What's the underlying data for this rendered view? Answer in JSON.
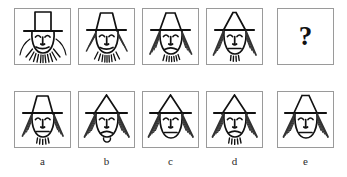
{
  "puzzle": {
    "type": "visual-matrix-reasoning",
    "title": "",
    "question_mark": "?",
    "sequence_row": {
      "name": "sequence",
      "cells": [
        {
          "id": "seq-1",
          "position": 1,
          "hat_shape": "rectangle",
          "hat_top_width": 34,
          "side_hair": "none",
          "beard": "long-rays",
          "beard_ray_count": 11,
          "mouth": "smile-curve"
        },
        {
          "id": "seq-2",
          "position": 2,
          "hat_shape": "wide-trapezoid",
          "hat_top_width": 26,
          "side_hair": "short-hatched",
          "beard": "medium-rays",
          "beard_ray_count": 9,
          "mouth": "smile-curve"
        },
        {
          "id": "seq-3",
          "position": 3,
          "hat_shape": "narrow-trapezoid",
          "hat_top_width": 18,
          "side_hair": "medium-hatched",
          "beard": "short-tufts",
          "beard_ray_count": 7,
          "mouth": "frown-curve"
        },
        {
          "id": "seq-4",
          "position": 4,
          "hat_shape": "triangle",
          "hat_top_width": 6,
          "side_hair": "long-hatched",
          "beard": "few-tufts",
          "beard_ray_count": 4,
          "mouth": "straight-line"
        },
        {
          "id": "seq-5",
          "position": 5,
          "hat_shape": "unknown",
          "side_hair": "unknown",
          "beard": "unknown",
          "mouth": "unknown",
          "is_question": true
        }
      ]
    },
    "options_row": {
      "name": "answer-options",
      "labels": [
        "a",
        "b",
        "c",
        "d",
        "e"
      ],
      "cells": [
        {
          "id": "opt-a",
          "label": "a",
          "hat_shape": "narrow-trapezoid",
          "hat_top_width": 20,
          "side_hair": "medium-hatched",
          "beard": "few-tufts",
          "beard_ray_count": 5,
          "mouth": "straight-line"
        },
        {
          "id": "opt-b",
          "label": "b",
          "hat_shape": "triangle",
          "hat_top_width": 4,
          "side_hair": "long-hatched",
          "beard": "single-tuft",
          "beard_ray_count": 1,
          "mouth": "frown-curve"
        },
        {
          "id": "opt-c",
          "label": "c",
          "hat_shape": "triangle",
          "hat_top_width": 4,
          "side_hair": "long-hatched",
          "beard": "none",
          "beard_ray_count": 0,
          "mouth": "straight-line"
        },
        {
          "id": "opt-d",
          "label": "d",
          "hat_shape": "triangle",
          "hat_top_width": 4,
          "side_hair": "long-hatched",
          "beard": "few-tufts",
          "beard_ray_count": 5,
          "mouth": "frown-curve"
        },
        {
          "id": "opt-e",
          "label": "e",
          "hat_shape": "narrow-trapezoid",
          "hat_top_width": 14,
          "side_hair": "long-hatched",
          "beard": "none",
          "beard_ray_count": 0,
          "mouth": "straight-line"
        }
      ]
    },
    "colors": {
      "ink": "#111111",
      "box_border": "#9a9a9a",
      "background": "#ffffff",
      "hair_hatch": "#333333"
    }
  }
}
